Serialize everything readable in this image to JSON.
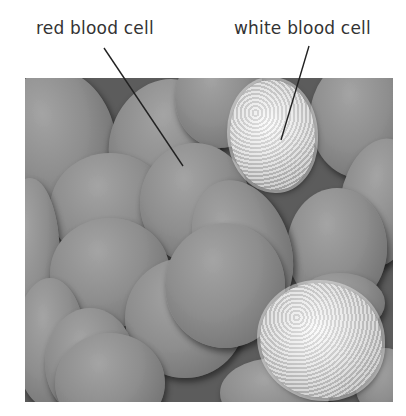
{
  "labels": {
    "red_blood_cell": "red blood cell",
    "white_blood_cell": "white blood cell"
  },
  "figure": {
    "type": "scanning electron micrograph (greyscale)",
    "annotations": [
      {
        "text": "red blood cell",
        "line_from": [
          104,
          48
        ],
        "line_to": [
          183,
          166
        ]
      },
      {
        "text": "white blood cell",
        "line_from": [
          309,
          46
        ],
        "line_to": [
          281,
          140
        ]
      }
    ]
  },
  "colors": {
    "label_text": "#333333",
    "leader_line": "#222222",
    "background": "#ffffff"
  }
}
